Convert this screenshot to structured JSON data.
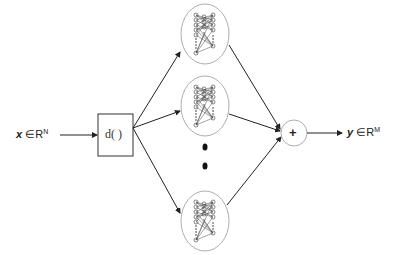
{
  "input": {
    "var": "x",
    "symbol": "∈",
    "space": "R",
    "dim": "N"
  },
  "output": {
    "var": "y",
    "symbol": "∈",
    "space": "R",
    "dim": "M"
  },
  "dropout_box": {
    "label": "d( )"
  },
  "adder": {
    "label": "+"
  },
  "networks": [
    {
      "id": "net-1",
      "cx": 205,
      "cy": 34
    },
    {
      "id": "net-2",
      "cx": 205,
      "cy": 106
    },
    {
      "id": "net-3",
      "cx": 205,
      "cy": 221
    }
  ],
  "ellipsis": {
    "dots": 2
  },
  "colors": {
    "stroke": "#333333",
    "ellipse": "#888888",
    "node": "#555555"
  }
}
